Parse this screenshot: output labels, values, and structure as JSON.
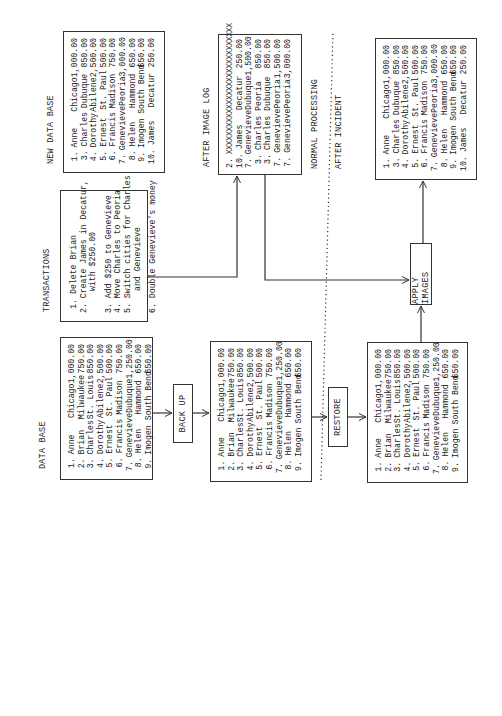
{
  "labels": {
    "data_base": "DATA BASE",
    "transactions": "TRANSACTIONS",
    "new_data_base": "NEW DATA BASE",
    "after_image_log": "AFTER IMAGE LOG",
    "normal_processing": "NORMAL PROCESSING",
    "after_incident": "AFTER INCIDENT"
  },
  "operations": {
    "back_up": "BACK UP",
    "restore": "RESTORE",
    "apply_images": "APPLY IMAGES"
  },
  "data_base": [
    {
      "num": "1.",
      "name": "Anne",
      "city": "Chicago",
      "amount": "1,000.00"
    },
    {
      "num": "2.",
      "name": "Brian",
      "city": "Milwaukee",
      "amount": "750.00"
    },
    {
      "num": "3.",
      "name": "Charles",
      "city": "St. Louis",
      "amount": "850.00"
    },
    {
      "num": "4.",
      "name": "Dorothy",
      "city": "Abilene",
      "amount": "2,500.00"
    },
    {
      "num": "5.",
      "name": "Ernest",
      "city": "St. Paul",
      "amount": "500.00"
    },
    {
      "num": "6.",
      "name": "Francis",
      "city": "Madison",
      "amount": "750.00"
    },
    {
      "num": "7.",
      "name": "Genevieve",
      "city": "Dubuque",
      "amount": "1,250.00"
    },
    {
      "num": "8.",
      "name": "Helen",
      "city": "Hammond",
      "amount": "650.00"
    },
    {
      "num": "9.",
      "name": "Imogen",
      "city": "South Bend",
      "amount": "650.00"
    }
  ],
  "backup_data_base": [
    {
      "num": "1.",
      "name": "Anne",
      "city": "Chicago",
      "amount": "1,000.00"
    },
    {
      "num": "2.",
      "name": "Brian",
      "city": "Milwaukee",
      "amount": "750.00"
    },
    {
      "num": "3.",
      "name": "Charles",
      "city": "St. Louis",
      "amount": "850.00"
    },
    {
      "num": "4.",
      "name": "Dorothy",
      "city": "Abilene",
      "amount": "2,500.00"
    },
    {
      "num": "5.",
      "name": "Ernest",
      "city": "St. Paul",
      "amount": "500.00"
    },
    {
      "num": "6.",
      "name": "Francis",
      "city": "Madison",
      "amount": "750.00"
    },
    {
      "num": "7.",
      "name": "Genevieve",
      "city": "Dubuque",
      "amount": "1,250.00"
    },
    {
      "num": "8.",
      "name": "Helen",
      "city": "Hammond",
      "amount": "650.00"
    },
    {
      "num": "9.",
      "name": "Imogen",
      "city": "South Bend",
      "amount": "650.00"
    }
  ],
  "restored_data_base": [
    {
      "num": "1.",
      "name": "Anne",
      "city": "Chicago",
      "amount": "1,000.00"
    },
    {
      "num": "2.",
      "name": "Brian",
      "city": "Milwaukee",
      "amount": "750.00"
    },
    {
      "num": "3.",
      "name": "Charles",
      "city": "St. Louis",
      "amount": "850.00"
    },
    {
      "num": "4.",
      "name": "Dorothy",
      "city": "Abilene",
      "amount": "2,500.00"
    },
    {
      "num": "5.",
      "name": "Ernest",
      "city": "St. Paul",
      "amount": "500.00"
    },
    {
      "num": "6.",
      "name": "Francis",
      "city": "Madison",
      "amount": "750.00"
    },
    {
      "num": "7.",
      "name": "Genevieve",
      "city": "Dubuque",
      "amount": "1,250.00"
    },
    {
      "num": "8.",
      "name": "Helen",
      "city": "Hammond",
      "amount": "650.00"
    },
    {
      "num": "9.",
      "name": "Imogen",
      "city": "South Bend",
      "amount": "650.00"
    }
  ],
  "transactions": [
    {
      "num": "1.",
      "text": "Delete Brian"
    },
    {
      "num": "2.",
      "text": "Create James in Decatur,"
    },
    {
      "num": "",
      "text": "with $250.00",
      "cont": true
    },
    {
      "num": "3.",
      "text": "Add $250 to Genevieve",
      "gap": true
    },
    {
      "num": "4.",
      "text": "Move Charles to Peoria"
    },
    {
      "num": "5.",
      "text": "Switch cities for Charles"
    },
    {
      "num": "",
      "text": "and Genevieve",
      "cont": true
    },
    {
      "num": "6.",
      "text": "Double Genevieve's money",
      "gap": true
    }
  ],
  "new_data_base": [
    {
      "num": "1.",
      "name": "Anne",
      "city": "Chicago",
      "amount": "1,000.00"
    },
    {
      "num": "3.",
      "name": "Charles",
      "city": "Dubuque",
      "amount": "850.00"
    },
    {
      "num": "4.",
      "name": "Dorothy",
      "city": "Abilene",
      "amount": "2,500.00"
    },
    {
      "num": "5.",
      "name": "Ernest",
      "city": "St. Paul",
      "amount": "500.00"
    },
    {
      "num": "6.",
      "name": "Francis",
      "city": "Madison",
      "amount": "750.00"
    },
    {
      "num": "7.",
      "name": "Genevieve",
      "city": "Peoria",
      "amount": "3,000.00"
    },
    {
      "num": "8.",
      "name": "Helen",
      "city": "Hammond",
      "amount": "650.00"
    },
    {
      "num": "9.",
      "name": "Imogen",
      "city": "South Bend",
      "amount": "650.00"
    },
    {
      "num": "10.",
      "name": "James",
      "city": "Decatur",
      "amount": "250.00"
    }
  ],
  "after_image_log": {
    "deleted": {
      "num": "2.",
      "text": "XXXXXXXXXXXXXXXXXXXXXXXXXXXXX"
    },
    "entries": [
      {
        "num": "10.",
        "name": "James",
        "city": "Decatur",
        "amount": "250.00"
      },
      {
        "num": "7.",
        "name": "Genevieve",
        "city": "Dubuque",
        "amount": "1,500.00"
      },
      {
        "num": "3.",
        "name": "Charles",
        "city": "Peoria",
        "amount": "850.00"
      },
      {
        "num": "3.",
        "name": "Charles",
        "city": "Dubuque",
        "amount": "850.00"
      },
      {
        "num": "7.",
        "name": "Genevieve",
        "city": "Peoria",
        "amount": "1,500.00"
      },
      {
        "num": "7.",
        "name": "Genevieve",
        "city": "Peoria",
        "amount": "3,000.00"
      }
    ]
  },
  "final_data_base": [
    {
      "num": "1.",
      "name": "Anne",
      "city": "Chicago",
      "amount": "1,000.00"
    },
    {
      "num": "3.",
      "name": "Charles",
      "city": "Dubuque",
      "amount": "850.00"
    },
    {
      "num": "4.",
      "name": "Dorothy",
      "city": "Abilene",
      "amount": "2,500.00"
    },
    {
      "num": "5.",
      "name": "Ernest",
      "city": "St. Paul",
      "amount": "500.00"
    },
    {
      "num": "6.",
      "name": "Francis",
      "city": "Madison",
      "amount": "750.00"
    },
    {
      "num": "7.",
      "name": "Genevieve",
      "city": "Peoria",
      "amount": "3,000.00"
    },
    {
      "num": "8.",
      "name": "Helen",
      "city": "Hammond",
      "amount": "650.00"
    },
    {
      "num": "9.",
      "name": "Imogen",
      "city": "South Bend",
      "amount": "650.00"
    },
    {
      "num": "10.",
      "name": "James",
      "city": "Decatur",
      "amount": "250.00"
    }
  ]
}
